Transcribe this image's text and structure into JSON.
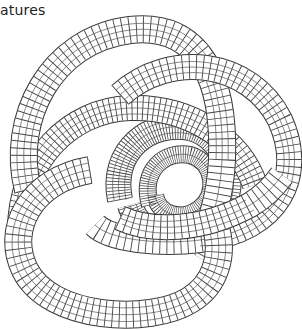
{
  "caption": "atures",
  "illustration": {
    "subject": "wireframe torus knot",
    "style": "black line mesh on white background",
    "line_color": "#3a3a3a",
    "background": "#ffffff"
  }
}
